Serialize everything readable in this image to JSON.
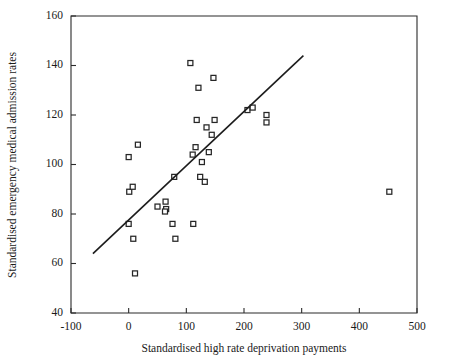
{
  "chart_data": {
    "type": "scatter",
    "title": "",
    "xlabel": "Standardised high rate deprivation payments",
    "ylabel": "Standardised emergency medical admission rates",
    "xlim": [
      -100,
      500
    ],
    "ylim": [
      40,
      160
    ],
    "xticks": [
      -100,
      0,
      100,
      200,
      300,
      400,
      500
    ],
    "xticklabels": [
      "-100",
      "0",
      "100",
      "200",
      "300",
      "400",
      "500"
    ],
    "yticks": [
      40,
      60,
      80,
      100,
      120,
      140,
      160
    ],
    "yticklabels": [
      "40",
      "60",
      "80",
      "100",
      "120",
      "140",
      "160"
    ],
    "grid": false,
    "legend": null,
    "marker_style": "open-square",
    "marker_size_px": 5,
    "series": [
      {
        "name": "Electoral wards",
        "points": [
          [
            0,
            103
          ],
          [
            16,
            108
          ],
          [
            1,
            89
          ],
          [
            7,
            91
          ],
          [
            0,
            76
          ],
          [
            8,
            70
          ],
          [
            11,
            56
          ],
          [
            50,
            83
          ],
          [
            64,
            85
          ],
          [
            65,
            82
          ],
          [
            63,
            81
          ],
          [
            76,
            76
          ],
          [
            81,
            70
          ],
          [
            79,
            95
          ],
          [
            107,
            141
          ],
          [
            121,
            131
          ],
          [
            147,
            135
          ],
          [
            111,
            104
          ],
          [
            116,
            107
          ],
          [
            118,
            118
          ],
          [
            127,
            101
          ],
          [
            135,
            115
          ],
          [
            139,
            105
          ],
          [
            144,
            112
          ],
          [
            149,
            118
          ],
          [
            112,
            76
          ],
          [
            124,
            95
          ],
          [
            132,
            93
          ],
          [
            206,
            122
          ],
          [
            215,
            123
          ],
          [
            239,
            120
          ],
          [
            239,
            117
          ],
          [
            452,
            89
          ]
        ]
      }
    ],
    "trend_line": {
      "name": "Regression line",
      "x0": -62,
      "y0": 64,
      "x1": 303,
      "y1": 144
    }
  },
  "axes": {
    "x_title": "Standardised high rate deprivation payments",
    "y_title": "Standardised emergency medical admission rates"
  }
}
